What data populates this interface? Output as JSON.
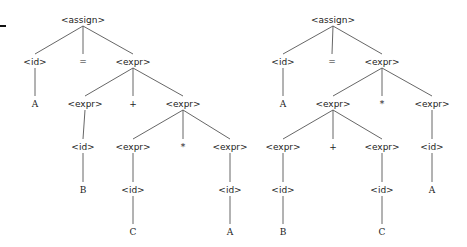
{
  "diagram": {
    "type": "parse-trees",
    "trees": [
      {
        "name": "left-tree",
        "nodes": [
          {
            "id": "L0",
            "label": "<assign>",
            "x": 83,
            "y": 20,
            "kind": "nt"
          },
          {
            "id": "L1",
            "label": "<id>",
            "x": 35,
            "y": 62,
            "kind": "nt"
          },
          {
            "id": "L2",
            "label": "=",
            "x": 83,
            "y": 62,
            "kind": "t"
          },
          {
            "id": "L3",
            "label": "<expr>",
            "x": 133,
            "y": 62,
            "kind": "nt"
          },
          {
            "id": "L4",
            "label": "A",
            "x": 35,
            "y": 104,
            "kind": "t"
          },
          {
            "id": "L5",
            "label": "<expr>",
            "x": 85,
            "y": 104,
            "kind": "nt"
          },
          {
            "id": "L6",
            "label": "+",
            "x": 133,
            "y": 104,
            "kind": "t"
          },
          {
            "id": "L7",
            "label": "<expr>",
            "x": 183,
            "y": 104,
            "kind": "nt"
          },
          {
            "id": "L8",
            "label": "<id>",
            "x": 83,
            "y": 147,
            "kind": "nt"
          },
          {
            "id": "L9",
            "label": "<expr>",
            "x": 133,
            "y": 147,
            "kind": "nt"
          },
          {
            "id": "L10",
            "label": "*",
            "x": 183,
            "y": 147,
            "kind": "t"
          },
          {
            "id": "L11",
            "label": "<expr>",
            "x": 230,
            "y": 147,
            "kind": "nt"
          },
          {
            "id": "L12",
            "label": "B",
            "x": 83,
            "y": 190,
            "kind": "t"
          },
          {
            "id": "L13",
            "label": "<id>",
            "x": 133,
            "y": 190,
            "kind": "nt"
          },
          {
            "id": "L14",
            "label": "<id>",
            "x": 230,
            "y": 190,
            "kind": "nt"
          },
          {
            "id": "L15",
            "label": "C",
            "x": 133,
            "y": 232,
            "kind": "t"
          },
          {
            "id": "L16",
            "label": "A",
            "x": 230,
            "y": 232,
            "kind": "t"
          }
        ],
        "edges": [
          [
            "L0",
            "L1"
          ],
          [
            "L0",
            "L2"
          ],
          [
            "L0",
            "L3"
          ],
          [
            "L1",
            "L4"
          ],
          [
            "L3",
            "L5"
          ],
          [
            "L3",
            "L6"
          ],
          [
            "L3",
            "L7"
          ],
          [
            "L5",
            "L8"
          ],
          [
            "L7",
            "L9"
          ],
          [
            "L7",
            "L10"
          ],
          [
            "L7",
            "L11"
          ],
          [
            "L8",
            "L12"
          ],
          [
            "L9",
            "L13"
          ],
          [
            "L11",
            "L14"
          ],
          [
            "L13",
            "L15"
          ],
          [
            "L14",
            "L16"
          ]
        ]
      },
      {
        "name": "right-tree",
        "nodes": [
          {
            "id": "R0",
            "label": "<assign>",
            "x": 333,
            "y": 20,
            "kind": "nt"
          },
          {
            "id": "R1",
            "label": "<id>",
            "x": 283,
            "y": 62,
            "kind": "nt"
          },
          {
            "id": "R2",
            "label": "=",
            "x": 332,
            "y": 62,
            "kind": "t"
          },
          {
            "id": "R3",
            "label": "<expr>",
            "x": 382,
            "y": 62,
            "kind": "nt"
          },
          {
            "id": "R4",
            "label": "A",
            "x": 283,
            "y": 104,
            "kind": "t"
          },
          {
            "id": "R5",
            "label": "<expr>",
            "x": 333,
            "y": 104,
            "kind": "nt"
          },
          {
            "id": "R6",
            "label": "*",
            "x": 382,
            "y": 104,
            "kind": "t"
          },
          {
            "id": "R7",
            "label": "<expr>",
            "x": 432,
            "y": 104,
            "kind": "nt"
          },
          {
            "id": "R8",
            "label": "<expr>",
            "x": 283,
            "y": 147,
            "kind": "nt"
          },
          {
            "id": "R9",
            "label": "+",
            "x": 333,
            "y": 147,
            "kind": "t"
          },
          {
            "id": "R10",
            "label": "<expr>",
            "x": 382,
            "y": 147,
            "kind": "nt"
          },
          {
            "id": "R11",
            "label": "<id>",
            "x": 432,
            "y": 147,
            "kind": "nt"
          },
          {
            "id": "R12",
            "label": "<id>",
            "x": 283,
            "y": 190,
            "kind": "nt"
          },
          {
            "id": "R13",
            "label": "<id>",
            "x": 382,
            "y": 190,
            "kind": "nt"
          },
          {
            "id": "R14",
            "label": "A",
            "x": 432,
            "y": 190,
            "kind": "t"
          },
          {
            "id": "R15",
            "label": "B",
            "x": 283,
            "y": 232,
            "kind": "t"
          },
          {
            "id": "R16",
            "label": "C",
            "x": 382,
            "y": 232,
            "kind": "t"
          }
        ],
        "edges": [
          [
            "R0",
            "R1"
          ],
          [
            "R0",
            "R2"
          ],
          [
            "R0",
            "R3"
          ],
          [
            "R1",
            "R4"
          ],
          [
            "R3",
            "R5"
          ],
          [
            "R3",
            "R6"
          ],
          [
            "R3",
            "R7"
          ],
          [
            "R5",
            "R8"
          ],
          [
            "R5",
            "R9"
          ],
          [
            "R5",
            "R10"
          ],
          [
            "R7",
            "R11"
          ],
          [
            "R8",
            "R12"
          ],
          [
            "R10",
            "R13"
          ],
          [
            "R11",
            "R14"
          ],
          [
            "R12",
            "R15"
          ],
          [
            "R13",
            "R16"
          ]
        ]
      }
    ]
  },
  "colors": {
    "edge": "#555555",
    "text": "#222222",
    "background": "#ffffff"
  }
}
